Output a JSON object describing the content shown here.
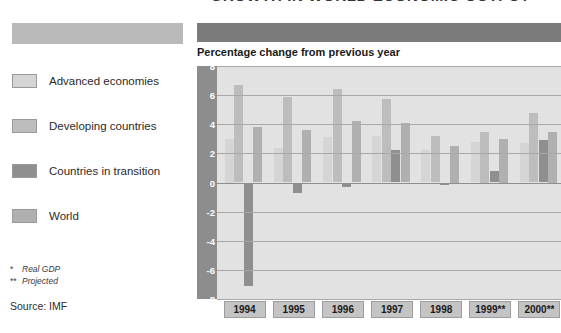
{
  "title": "GROWTH IN WORLD ECONOMIC OUTPUT*",
  "chart_subtitle": "Percentage change from previous year",
  "legend": [
    {
      "label": "Advanced economies",
      "color": "#d5d5d5"
    },
    {
      "label": "Developing countries",
      "color": "#bdbdbd"
    },
    {
      "label": "Countries in transition",
      "color": "#8f8f8f"
    },
    {
      "label": "World",
      "color": "#b0b0b0"
    }
  ],
  "footnotes": [
    {
      "mark": "*",
      "text": "Real GDP"
    },
    {
      "mark": "**",
      "text": "Projected"
    }
  ],
  "source": "Source: IMF",
  "colors": {
    "left_band": "#b9b9b9",
    "right_band": "#7b7b7b",
    "axis_band": "#8d8d8d",
    "plot_background": "#e2e2e2",
    "gridline": "#a8a8a8",
    "year_box": "#c4c4c4"
  },
  "chart_data": {
    "type": "bar",
    "title": "GROWTH IN WORLD ECONOMIC OUTPUT*",
    "subtitle": "Percentage change from previous year",
    "xlabel": "",
    "ylabel": "Percentage change from previous year",
    "ylim": [
      -8,
      8
    ],
    "yticks": [
      8,
      6,
      4,
      2,
      0,
      -2,
      -4,
      -6,
      -8
    ],
    "grid": true,
    "legend_position": "left",
    "categories": [
      "1994",
      "1995",
      "1996",
      "1997",
      "1998",
      "1999**",
      "2000**"
    ],
    "series": [
      {
        "name": "Advanced economies",
        "color": "#d5d5d5",
        "values": [
          3.0,
          2.4,
          3.1,
          3.2,
          2.2,
          2.8,
          2.7
        ]
      },
      {
        "name": "Developing countries",
        "color": "#bdbdbd",
        "values": [
          6.7,
          5.9,
          6.4,
          5.7,
          3.2,
          3.5,
          4.8
        ]
      },
      {
        "name": "Countries in transition",
        "color": "#8f8f8f",
        "values": [
          -7.1,
          -0.7,
          -0.3,
          2.2,
          -0.2,
          0.8,
          2.9
        ]
      },
      {
        "name": "World",
        "color": "#b0b0b0",
        "values": [
          3.8,
          3.6,
          4.2,
          4.1,
          2.5,
          3.0,
          3.5
        ]
      }
    ]
  }
}
